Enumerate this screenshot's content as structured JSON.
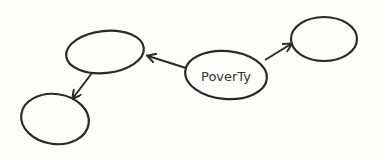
{
  "diagram": {
    "type": "concept-map",
    "style": "hand-drawn",
    "colors": {
      "background": "#fdfdfb",
      "stroke": "#2a2a2a"
    },
    "nodes": [
      {
        "id": "poverty",
        "label": "PoverTy"
      },
      {
        "id": "top-left",
        "label": ""
      },
      {
        "id": "top-right",
        "label": ""
      },
      {
        "id": "bottom-left",
        "label": ""
      }
    ],
    "edges": [
      {
        "from": "poverty",
        "to": "top-left"
      },
      {
        "from": "poverty",
        "to": "top-right"
      },
      {
        "from": "top-left",
        "to": "bottom-left"
      }
    ]
  }
}
